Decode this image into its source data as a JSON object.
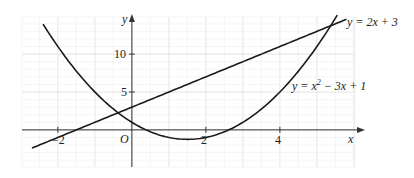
{
  "chart_data": {
    "type": "line",
    "title": "",
    "xlabel": "x",
    "ylabel": "y",
    "origin_label": "O",
    "xlim": [
      -2.97,
      6.03
    ],
    "ylim": [
      -4.9,
      14.9
    ],
    "x_ticks": [
      {
        "value": -2,
        "label": "−2"
      },
      {
        "value": 2,
        "label": "2"
      },
      {
        "value": 4,
        "label": "4"
      }
    ],
    "y_ticks": [
      {
        "value": 5,
        "label": "5"
      },
      {
        "value": 10,
        "label": "10"
      }
    ],
    "grid": {
      "on": true,
      "minor_x": 0.5,
      "minor_y": 1,
      "major_x": 1,
      "major_y": 5
    },
    "series": [
      {
        "name": "line",
        "label": "y = 2x + 3",
        "equation": "2x+3",
        "x_range": [
          -2.7,
          5.8
        ]
      },
      {
        "name": "parabola",
        "label": "y = x² − 3x + 1",
        "equation": "x^2-3x+1",
        "x_range": [
          -2.4,
          5.55
        ]
      }
    ],
    "intersections": [
      {
        "x": -0.37,
        "y": 2.25
      },
      {
        "x": 5.37,
        "y": 13.75
      }
    ]
  },
  "labels": {
    "line_label": "y = 2x + 3",
    "parabola_label_prefix": "y = x",
    "parabola_label_sup": "2",
    "parabola_label_suffix": " − 3x + 1",
    "x_axis": "x",
    "y_axis": "y",
    "origin": "O",
    "tick_neg2": "−2",
    "tick_2": "2",
    "tick_4": "4",
    "tick_5": "5",
    "tick_10": "10"
  },
  "colors": {
    "curve": "#1a1a1a",
    "axis": "#333333",
    "grid_minor": "#eeeeee",
    "grid_major": "#dddddd"
  }
}
